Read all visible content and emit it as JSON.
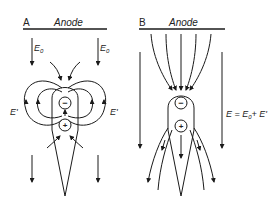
{
  "panels": [
    {
      "id": "A",
      "letter": "A",
      "electrode_label": "Anode",
      "field_label_left": "E",
      "field_sub_left": "0",
      "field_label_right": "E",
      "field_sub_right": "0",
      "dipole_label_left": "E'",
      "dipole_label_right": "E'",
      "charge_top": "−",
      "charge_bottom": "+"
    },
    {
      "id": "B",
      "letter": "B",
      "electrode_label": "Anode",
      "equation_E": "E = E",
      "equation_sub": "0",
      "equation_rest": "+ E'",
      "charge_top": "−",
      "charge_bottom": "+"
    }
  ],
  "colors": {
    "line": "#1a1a1a",
    "background": "#ffffff"
  }
}
